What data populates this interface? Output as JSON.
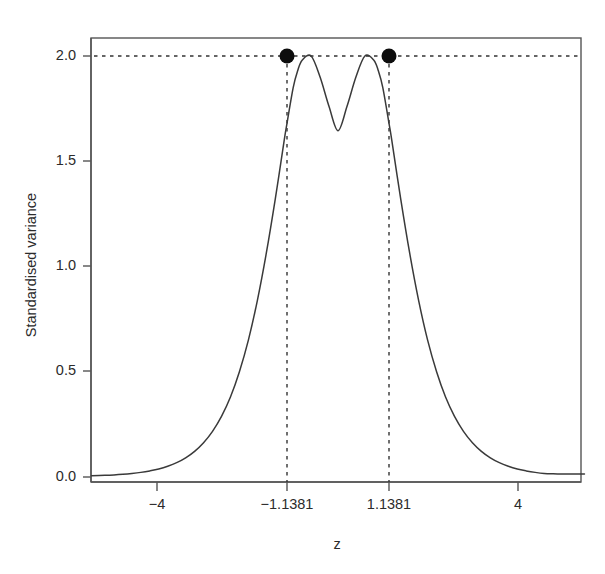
{
  "chart_data": {
    "type": "line",
    "title": "",
    "subtitle": "",
    "xlabel": "z",
    "ylabel": "Standardised variance",
    "xlim": [
      -5.5,
      5.5
    ],
    "ylim": [
      -0.02,
      2.08
    ],
    "grid": false,
    "legend": null,
    "x_ticks": [
      -4,
      -1.1381,
      1.1381,
      4
    ],
    "x_tick_labels": [
      "−4",
      "−1.1381",
      "1.1381",
      "4"
    ],
    "y_ticks": [
      0.0,
      0.5,
      1.0,
      1.5,
      2.0
    ],
    "y_tick_labels": [
      "0.0",
      "0.5",
      "1.0",
      "1.5",
      "2.0"
    ],
    "series": [
      {
        "name": "Standardised variance",
        "x": [
          -5.5,
          -5.2,
          -5.0,
          -4.8,
          -4.6,
          -4.4,
          -4.2,
          -4.0,
          -3.8,
          -3.6,
          -3.4,
          -3.2,
          -3.0,
          -2.8,
          -2.6,
          -2.4,
          -2.2,
          -2.0,
          -1.8,
          -1.6,
          -1.4,
          -1.2,
          -1.1381,
          -1.0,
          -0.9,
          -0.8,
          -0.6,
          -0.4,
          -0.2,
          0.0,
          0.2,
          0.4,
          0.6,
          0.8,
          0.9,
          1.0,
          1.1381,
          1.2,
          1.4,
          1.6,
          1.8,
          2.0,
          2.2,
          2.4,
          2.6,
          2.8,
          3.0,
          3.2,
          3.4,
          3.6,
          3.8,
          4.0,
          4.2,
          4.4,
          4.6,
          4.8,
          5.0,
          5.2,
          5.5
        ],
        "y": [
          0.006,
          0.008,
          0.01,
          0.013,
          0.017,
          0.022,
          0.029,
          0.038,
          0.051,
          0.068,
          0.091,
          0.122,
          0.163,
          0.217,
          0.288,
          0.38,
          0.5,
          0.65,
          0.838,
          1.063,
          1.32,
          1.6,
          1.68,
          1.85,
          1.93,
          1.98,
          2.0,
          1.9,
          1.76,
          1.645,
          1.76,
          1.9,
          2.0,
          1.98,
          1.93,
          1.85,
          1.68,
          1.6,
          1.32,
          1.063,
          0.838,
          0.65,
          0.5,
          0.38,
          0.288,
          0.217,
          0.163,
          0.122,
          0.091,
          0.068,
          0.051,
          0.038,
          0.029,
          0.022,
          0.017,
          0.015,
          0.014,
          0.014,
          0.014
        ]
      }
    ],
    "reference_lines": [
      {
        "orientation": "horizontal",
        "value": 2.0,
        "style": "dashed",
        "label": "maximum standardised variance"
      },
      {
        "orientation": "vertical",
        "value": -1.1381,
        "style": "dashed",
        "label": "left optimal design point"
      },
      {
        "orientation": "vertical",
        "value": 1.1381,
        "style": "dashed",
        "label": "right optimal design point"
      }
    ],
    "points": [
      {
        "x": -1.1381,
        "y": 2.0,
        "marker": "filled-circle",
        "label": "left peak"
      },
      {
        "x": 1.1381,
        "y": 2.0,
        "marker": "filled-circle",
        "label": "right peak"
      }
    ],
    "colors": {
      "curve": "#3a3a3a",
      "point": "#0d0d0d",
      "reference": "#333333",
      "axis": "#555555",
      "background": "#ffffff",
      "text": "#2b2b2b"
    }
  }
}
